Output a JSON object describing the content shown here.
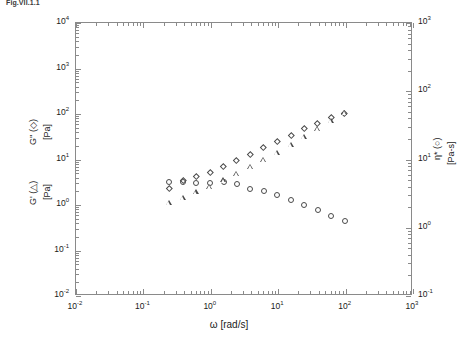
{
  "figure": {
    "caption": "Fig.VII.1.1"
  },
  "chart_data": {
    "type": "scatter",
    "title": "",
    "xlabel": "ω [rad/s]",
    "ylabel_left": "G'' (◇) [Pa]   G' (△) [Pa]",
    "ylabel_right": "η* (○) [Pa-s]",
    "xscale": "log",
    "yscale": "log",
    "xlim": [
      0.01,
      1000
    ],
    "ylim_left": [
      0.01,
      10000
    ],
    "ylim_right": [
      0.1,
      1000
    ],
    "grid": false,
    "legend": "inline-in-axis-labels",
    "xticks": [
      "10⁻²",
      "10⁻¹",
      "10⁰",
      "10¹",
      "10²",
      "10³"
    ],
    "xtick_values": [
      0.01,
      0.1,
      1,
      10,
      100,
      1000
    ],
    "yticks_left": [
      "10⁻²",
      "10⁻¹",
      "10⁰",
      "10¹",
      "10²",
      "10³",
      "10⁴"
    ],
    "ytick_values_left": [
      0.01,
      0.1,
      1,
      10,
      100,
      1000,
      10000
    ],
    "yticks_right": [
      "10⁻¹",
      "10⁰",
      "10¹",
      "10²",
      "10³"
    ],
    "ytick_values_right": [
      0.1,
      1,
      10,
      100,
      1000
    ],
    "series": [
      {
        "name": "η* (complex viscosity)",
        "marker": "circle",
        "axis": "right",
        "x": [
          0.25,
          0.4,
          0.63,
          1.0,
          1.6,
          2.5,
          4.0,
          6.3,
          10,
          16,
          25,
          40,
          63,
          100
        ],
        "y": [
          4.6,
          4.6,
          4.4,
          4.4,
          4.6,
          4.3,
          3.6,
          3.3,
          2.9,
          2.5,
          2.1,
          1.75,
          1.45,
          1.2
        ]
      },
      {
        "name": "G'' (loss modulus)",
        "marker": "diamond",
        "axis": "left",
        "x": [
          0.25,
          0.4,
          0.63,
          1.0,
          1.6,
          2.5,
          4.0,
          6.3,
          10,
          16,
          25,
          40,
          63,
          100
        ],
        "y": [
          2.2,
          3.3,
          4.1,
          5.1,
          6.6,
          9.0,
          12.5,
          17.5,
          24,
          33,
          45,
          60,
          80,
          100
        ]
      },
      {
        "name": "G' (storage modulus)",
        "marker": "triangle",
        "axis": "left",
        "x": [
          0.25,
          0.4,
          0.63,
          1.0,
          1.6,
          2.5,
          4.0,
          6.3,
          10,
          16,
          25,
          40,
          63,
          100
        ],
        "y": [
          1.05,
          1.35,
          1.8,
          2.4,
          3.3,
          4.5,
          6.4,
          9.2,
          13.5,
          20,
          30,
          45,
          68,
          100
        ]
      }
    ]
  }
}
